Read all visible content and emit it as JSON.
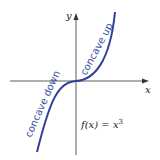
{
  "diagram": {
    "function_label": "f(x) = x",
    "exponent": "3",
    "x_axis_label": "x",
    "y_axis_label": "y",
    "annotations": [
      "concave up",
      "concave down"
    ],
    "curve_color": "#2f3f9a"
  }
}
